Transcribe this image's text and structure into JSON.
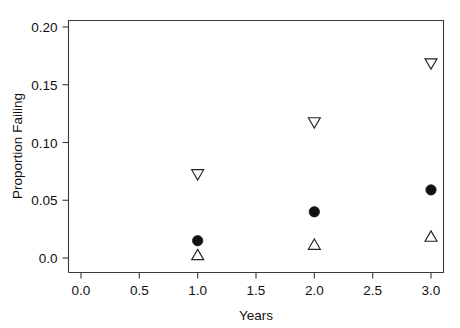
{
  "chart_data": {
    "type": "scatter",
    "title": "",
    "xlabel": "Years",
    "ylabel": "Proportion Failing",
    "xlim": [
      0.0,
      3.15
    ],
    "ylim": [
      0.0,
      0.21
    ],
    "grid": false,
    "legend": "none",
    "x_ticks": [
      {
        "value": 0.0,
        "label": "0.0"
      },
      {
        "value": 0.5,
        "label": "0.5"
      },
      {
        "value": 1.0,
        "label": "1.0"
      },
      {
        "value": 1.5,
        "label": "1.5"
      },
      {
        "value": 2.0,
        "label": "2.0"
      },
      {
        "value": 2.5,
        "label": "2.5"
      },
      {
        "value": 3.0,
        "label": "3.0"
      }
    ],
    "y_ticks": [
      {
        "value": 0.0,
        "label": "0.0"
      },
      {
        "value": 0.05,
        "label": "0.05"
      },
      {
        "value": 0.1,
        "label": "0.10"
      },
      {
        "value": 0.15,
        "label": "0.15"
      },
      {
        "value": 0.2,
        "label": "0.20"
      }
    ],
    "x": [
      1.0,
      2.0,
      3.0
    ],
    "series": [
      {
        "name": "upper-bound",
        "marker": "triangle-down-open",
        "color": "#222222",
        "values": [
          0.072,
          0.117,
          0.168
        ]
      },
      {
        "name": "estimate",
        "marker": "circle-filled",
        "color": "#111111",
        "values": [
          0.015,
          0.04,
          0.059
        ]
      },
      {
        "name": "lower-bound",
        "marker": "triangle-up-open",
        "color": "#222222",
        "values": [
          0.003,
          0.012,
          0.019
        ]
      }
    ]
  }
}
